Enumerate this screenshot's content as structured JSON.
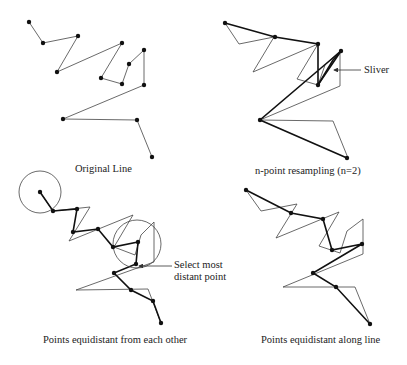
{
  "panels": [
    {
      "id": "original",
      "caption": "Original Line",
      "caption_pos": [
        109,
        169
      ],
      "original_line": [
        [
          29,
          22
        ],
        [
          43,
          43
        ],
        [
          78,
          36
        ],
        [
          57,
          72
        ],
        [
          122,
          43
        ],
        [
          101,
          78
        ],
        [
          122,
          84
        ],
        [
          129,
          64
        ],
        [
          144,
          50
        ],
        [
          144,
          85
        ],
        [
          63,
          119
        ],
        [
          137,
          120
        ],
        [
          152,
          157
        ]
      ],
      "points": [
        [
          29,
          22
        ],
        [
          43,
          43
        ],
        [
          78,
          36
        ],
        [
          57,
          72
        ],
        [
          122,
          43
        ],
        [
          101,
          78
        ],
        [
          122,
          84
        ],
        [
          129,
          64
        ],
        [
          144,
          50
        ],
        [
          144,
          85
        ],
        [
          63,
          119
        ],
        [
          137,
          120
        ],
        [
          152,
          157
        ]
      ]
    },
    {
      "id": "n-point",
      "caption": "n-point resampling (n=2)",
      "caption_pos": [
        312,
        171
      ],
      "annotation": "Sliver",
      "annotation_pos": [
        363,
        66
      ],
      "original_line": [
        [
          225,
          23
        ],
        [
          239,
          44
        ],
        [
          274,
          37
        ],
        [
          253,
          72
        ],
        [
          318,
          44
        ],
        [
          297,
          79
        ],
        [
          318,
          85
        ],
        [
          325,
          65
        ],
        [
          340,
          51
        ],
        [
          340,
          86
        ],
        [
          260,
          120
        ],
        [
          333,
          121
        ],
        [
          348,
          158
        ]
      ],
      "resampled_line": [
        [
          225,
          23
        ],
        [
          275,
          37
        ],
        [
          318,
          44
        ],
        [
          318,
          85
        ],
        [
          341,
          51
        ],
        [
          260,
          120
        ],
        [
          347,
          158
        ]
      ],
      "sliver_line": [
        [
          318,
          85
        ],
        [
          333,
          60
        ],
        [
          341,
          51
        ]
      ],
      "points": [
        [
          225,
          23
        ],
        [
          275,
          37
        ],
        [
          318,
          44
        ],
        [
          318,
          85
        ],
        [
          341,
          51
        ],
        [
          260,
          120
        ],
        [
          347,
          158
        ]
      ]
    },
    {
      "id": "equidistant-each-other",
      "caption": "Points equidistant from each other",
      "caption_pos": [
        118,
        340
      ],
      "annotation": "Select most\ndistant point",
      "annotation_line1": "Select most",
      "annotation_line2": "distant point",
      "annotation_pos": [
        174,
        263
      ],
      "original_line": [
        [
          40,
          192
        ],
        [
          53,
          211
        ],
        [
          90,
          207
        ],
        [
          69,
          241
        ],
        [
          133,
          215
        ],
        [
          114,
          247
        ],
        [
          135,
          255
        ],
        [
          141,
          235
        ],
        [
          154,
          222
        ],
        [
          154,
          262
        ],
        [
          76,
          290
        ],
        [
          148,
          289
        ],
        [
          161,
          323
        ]
      ],
      "resampled_line": [
        [
          40,
          192
        ],
        [
          53,
          211
        ],
        [
          77,
          209
        ],
        [
          73,
          232
        ],
        [
          98,
          229
        ],
        [
          113,
          247
        ],
        [
          138,
          242
        ],
        [
          136,
          264
        ],
        [
          114,
          273
        ],
        [
          131,
          290
        ],
        [
          153,
          301
        ],
        [
          161,
          323
        ]
      ],
      "circles": [
        {
          "cx": 40,
          "cy": 192,
          "r": 21
        },
        {
          "cx": 137,
          "cy": 244,
          "r": 24
        }
      ],
      "points": [
        [
          40,
          192
        ],
        [
          53,
          211
        ],
        [
          77,
          209
        ],
        [
          73,
          232
        ],
        [
          98,
          229
        ],
        [
          113,
          247
        ],
        [
          138,
          242
        ],
        [
          136,
          264
        ],
        [
          114,
          273
        ],
        [
          131,
          290
        ],
        [
          153,
          301
        ],
        [
          161,
          323
        ]
      ]
    },
    {
      "id": "equidistant-along-line",
      "caption": "Points equidistant along line",
      "caption_pos": [
        322,
        340
      ],
      "original_line": [
        [
          246,
          190
        ],
        [
          261,
          211
        ],
        [
          297,
          204
        ],
        [
          276,
          238
        ],
        [
          339,
          212
        ],
        [
          319,
          246
        ],
        [
          340,
          253
        ],
        [
          347,
          231
        ],
        [
          363,
          219
        ],
        [
          363,
          254
        ],
        [
          283,
          287
        ],
        [
          355,
          287
        ],
        [
          370,
          324
        ]
      ],
      "resampled_line": [
        [
          246,
          190
        ],
        [
          291,
          213
        ],
        [
          323,
          219
        ],
        [
          332,
          250
        ],
        [
          362,
          244
        ],
        [
          313,
          273
        ],
        [
          336,
          287
        ],
        [
          370,
          324
        ]
      ],
      "points": [
        [
          246,
          190
        ],
        [
          291,
          213
        ],
        [
          323,
          219
        ],
        [
          332,
          250
        ],
        [
          362,
          244
        ],
        [
          313,
          273
        ],
        [
          336,
          287
        ],
        [
          370,
          324
        ]
      ]
    }
  ],
  "arrows": [
    {
      "from": [
        361,
        70
      ],
      "to": [
        334,
        70
      ]
    },
    {
      "from": [
        172,
        266
      ],
      "to": [
        139,
        266
      ]
    }
  ]
}
